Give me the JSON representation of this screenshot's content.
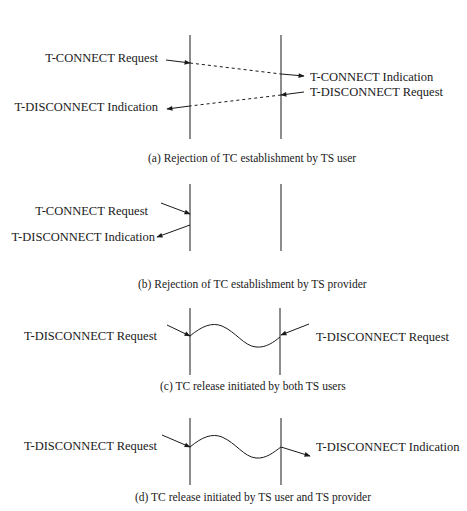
{
  "panels": [
    {
      "id": "a",
      "caption": "(a) Rejection of TC establishment by TS user",
      "left_labels": [
        "T-CONNECT Request",
        "T-DISCONNECT Indication"
      ],
      "right_labels": [
        "T-CONNECT Indication",
        "T-DISCONNECT Request"
      ],
      "line_style": "dashed"
    },
    {
      "id": "b",
      "caption": "(b) Rejection of TC establishment by TS provider",
      "left_labels": [
        "T-CONNECT Request",
        "T-DISCONNECT Indication"
      ],
      "right_labels": []
    },
    {
      "id": "c",
      "caption": "(c) TC release initiated by both TS users",
      "left_labels": [
        "T-DISCONNECT Request"
      ],
      "right_labels": [
        "T-DISCONNECT Request"
      ],
      "line_style": "wave"
    },
    {
      "id": "d",
      "caption": "(d) TC release initiated by TS user and TS provider",
      "left_labels": [
        "T-DISCONNECT Request"
      ],
      "right_labels": [
        "T-DISCONNECT Indication"
      ],
      "line_style": "wave"
    }
  ],
  "colors": {
    "ink": "#1a1a1a",
    "background": "#ffffff"
  }
}
